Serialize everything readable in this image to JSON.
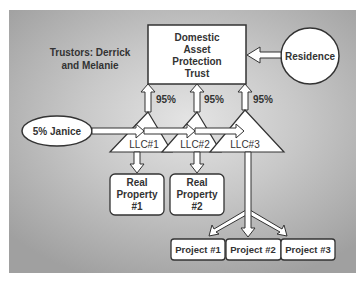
{
  "diagram": {
    "trustors_label": [
      "Trustors: Derrick",
      "and Melanie"
    ],
    "trust": {
      "lines": [
        "Domestic",
        "Asset",
        "Protection",
        "Trust"
      ]
    },
    "residence": {
      "label": "Residence"
    },
    "janice": {
      "label": "5% Janice"
    },
    "ownership": [
      {
        "label": "95%"
      },
      {
        "label": "95%"
      },
      {
        "label": "95%"
      }
    ],
    "llcs": [
      {
        "label": "LLC#1"
      },
      {
        "label": "LLC#2"
      },
      {
        "label": "LLC#3"
      }
    ],
    "properties": [
      {
        "lines": [
          "Real",
          "Property",
          "#1"
        ]
      },
      {
        "lines": [
          "Real",
          "Property",
          "#2"
        ]
      }
    ],
    "projects": [
      {
        "label": "Project #1"
      },
      {
        "label": "Project #2"
      },
      {
        "label": "Project #3"
      }
    ],
    "colors": {
      "box_fill": "#ffffff",
      "stroke": "#333333",
      "text": "#333333",
      "bg_center": "#e4e4e4",
      "bg_edge": "#a0a0a0"
    }
  }
}
